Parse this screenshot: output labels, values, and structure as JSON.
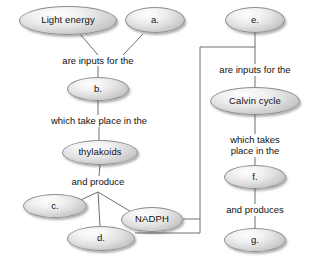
{
  "diagram": {
    "theme": {
      "edge_color": "#6f6f6f",
      "node_border": "#8e8e8e",
      "node_fill_light": "#fdfdfd",
      "node_fill_dark": "#c2c2c2",
      "text_color": "#111111",
      "background": "#ffffff"
    },
    "nodes": [
      {
        "id": "light_energy",
        "label": "Light energy",
        "cx": 68,
        "cy": 20,
        "w": 98,
        "h": 29
      },
      {
        "id": "a",
        "label": "a.",
        "cx": 155,
        "cy": 20,
        "w": 60,
        "h": 26
      },
      {
        "id": "e",
        "label": "e.",
        "cx": 255,
        "cy": 20,
        "w": 60,
        "h": 26
      },
      {
        "id": "b",
        "label": "b.",
        "cx": 98,
        "cy": 89,
        "w": 62,
        "h": 24
      },
      {
        "id": "calvin_cycle",
        "label": "Calvin cycle",
        "cx": 255,
        "cy": 101,
        "w": 90,
        "h": 28
      },
      {
        "id": "thylakoids",
        "label": "thylakoids",
        "cx": 100,
        "cy": 152,
        "w": 76,
        "h": 25
      },
      {
        "id": "f",
        "label": "f.",
        "cx": 255,
        "cy": 177,
        "w": 62,
        "h": 24
      },
      {
        "id": "c",
        "label": "c.",
        "cx": 55,
        "cy": 206,
        "w": 64,
        "h": 24
      },
      {
        "id": "nadph",
        "label": "NADPH",
        "cx": 152,
        "cy": 219,
        "w": 62,
        "h": 25
      },
      {
        "id": "d",
        "label": "d.",
        "cx": 101,
        "cy": 238,
        "w": 68,
        "h": 25
      },
      {
        "id": "g",
        "label": "g.",
        "cx": 255,
        "cy": 240,
        "w": 62,
        "h": 24
      }
    ],
    "edge_labels": [
      {
        "id": "lbl_inputs_left",
        "text": "are inputs for the",
        "cx": 98,
        "cy": 61,
        "lines": 1
      },
      {
        "id": "lbl_take_place",
        "text": "which take place in the",
        "cx": 99,
        "cy": 121,
        "lines": 1
      },
      {
        "id": "lbl_and_produce",
        "text": "and produce",
        "cx": 98,
        "cy": 182,
        "lines": 1
      },
      {
        "id": "lbl_inputs_right",
        "text": "are inputs for the",
        "cx": 255,
        "cy": 70,
        "lines": 1
      },
      {
        "id": "lbl_takes_place",
        "text": "which takes\nplace in the",
        "cx": 255,
        "cy": 145,
        "lines": 2
      },
      {
        "id": "lbl_and_produces",
        "text": "and produces",
        "cx": 255,
        "cy": 210,
        "lines": 1
      }
    ],
    "edges": [
      {
        "id": "e_light_to_inputs",
        "from": "light_energy",
        "to": "lbl_inputs_left",
        "points": "80,34 98,55"
      },
      {
        "id": "e_a_to_inputs",
        "from": "a",
        "to": "lbl_inputs_left",
        "points": "143,34 123,55"
      },
      {
        "id": "e_inputs_to_b",
        "from": "lbl_inputs_left",
        "to": "b",
        "points": "98,66 98,77"
      },
      {
        "id": "e_b_to_takeplace",
        "from": "b",
        "to": "lbl_take_place",
        "points": "98,101 98,115"
      },
      {
        "id": "e_takeplace_to_thyl",
        "from": "lbl_take_place",
        "to": "thylakoids",
        "points": "99,127 99,140"
      },
      {
        "id": "e_thyl_to_produce",
        "from": "thylakoids",
        "to": "lbl_and_produce",
        "points": "100,165 99,176"
      },
      {
        "id": "e_produce_to_c",
        "from": "lbl_and_produce",
        "to": "c",
        "points": "98,192 74,203"
      },
      {
        "id": "e_produce_to_d",
        "from": "lbl_and_produce",
        "to": "d",
        "points": "98,192 100,226"
      },
      {
        "id": "e_produce_to_nadph",
        "from": "lbl_and_produce",
        "to": "nadph",
        "points": "98,192 133,213"
      },
      {
        "id": "e_e_to_inputs_right",
        "from": "e",
        "to": "lbl_inputs_right",
        "points": "255,33 255,64"
      },
      {
        "id": "e_inputsr_to_calvin",
        "from": "lbl_inputs_right",
        "to": "calvin_cycle",
        "points": "255,76 255,88"
      },
      {
        "id": "e_calvin_to_takes",
        "from": "calvin_cycle",
        "to": "lbl_takes_place",
        "points": "255,115 255,134"
      },
      {
        "id": "e_takes_to_f",
        "from": "lbl_takes_place",
        "to": "f",
        "points": "255,157 255,166"
      },
      {
        "id": "e_f_to_produces",
        "from": "f",
        "to": "lbl_and_produces",
        "points": "255,189 255,204"
      },
      {
        "id": "e_produces_to_g",
        "from": "lbl_and_produces",
        "to": "g",
        "points": "255,216 255,229"
      },
      {
        "id": "e_nadph_bus",
        "from": "nadph",
        "to": "bus",
        "points": "183,219 200,219"
      },
      {
        "id": "e_d_bus",
        "from": "d",
        "to": "bus",
        "points": "135,233 200,233"
      },
      {
        "id": "e_bus_vertical",
        "from": "bus",
        "to": "top_corner",
        "points": "200,233 200,47"
      },
      {
        "id": "e_bus_to_e",
        "from": "top_corner",
        "to": "e",
        "points": "200,47 255,47"
      }
    ]
  }
}
